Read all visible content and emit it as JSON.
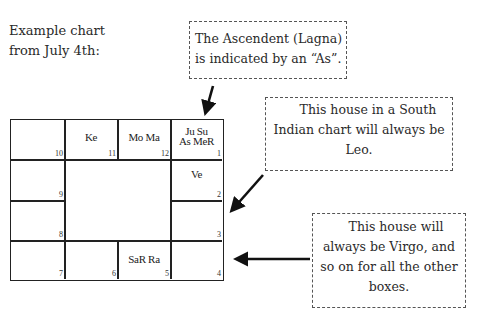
{
  "intro": {
    "lines": [
      "Example chart",
      "from July 4th:"
    ]
  },
  "callouts": [
    {
      "id": "ascendant-note",
      "lines": [
        "The Ascendent (Lagna)",
        "is indicated by an “As”."
      ]
    },
    {
      "id": "leo-note",
      "lines": [
        "This house in a South",
        "Indian chart will always be",
        "Leo."
      ]
    },
    {
      "id": "virgo-note",
      "lines": [
        "This house will",
        "always be Virgo, and",
        "so on for all the other",
        "boxes."
      ]
    }
  ],
  "chart": {
    "type": "South Indian chart",
    "houses": [
      {
        "number": "10",
        "planets": []
      },
      {
        "number": "11",
        "planets": [
          "Ke"
        ]
      },
      {
        "number": "12",
        "planets": [
          "Mo Ma"
        ]
      },
      {
        "number": "1",
        "planets": [
          "Ju Su",
          "As MeR"
        ]
      },
      {
        "number": "2",
        "planets": [
          "Ve"
        ]
      },
      {
        "number": "3",
        "planets": []
      },
      {
        "number": "4",
        "planets": []
      },
      {
        "number": "5",
        "planets": [
          "SaR Ra"
        ]
      },
      {
        "number": "6",
        "planets": []
      },
      {
        "number": "7",
        "planets": []
      },
      {
        "number": "8",
        "planets": []
      },
      {
        "number": "9",
        "planets": []
      }
    ]
  },
  "colors": {
    "line": "#222222",
    "text": "#2a2a2a",
    "dash": "#555555"
  }
}
